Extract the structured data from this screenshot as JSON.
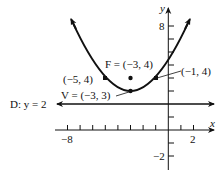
{
  "figure": {
    "type": "parabola-graph",
    "equation_implied": "(x + 3)^2 = 4(y - 3)",
    "axes": {
      "x_label": "x",
      "y_label": "y",
      "x_tick_labels": [
        {
          "value": -8,
          "text": "−8"
        },
        {
          "value": 2,
          "text": "2"
        }
      ],
      "y_tick_labels": [
        {
          "value": 8,
          "text": "8"
        },
        {
          "value": -2,
          "text": "−2"
        }
      ],
      "x_range": [
        -8,
        3
      ],
      "y_range": [
        -3,
        9
      ]
    },
    "labels": {
      "focus": "F = (−3, 4)",
      "vertex": "V = (−3, 3)",
      "left_point": "(−5, 4)",
      "right_point": "(−1, 4)",
      "directrix": "D: y = 2"
    },
    "points": [
      {
        "name": "vertex",
        "x": -3,
        "y": 3
      },
      {
        "name": "focus",
        "x": -3,
        "y": 4
      },
      {
        "name": "left_point",
        "x": -5,
        "y": 4
      },
      {
        "name": "right_point",
        "x": -1,
        "y": 4
      }
    ],
    "directrix_y": 2,
    "colors": {
      "ink": "#111111",
      "background": "#ffffff"
    }
  }
}
